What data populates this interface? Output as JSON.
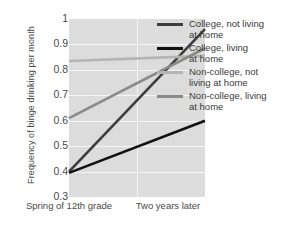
{
  "chart_data": {
    "type": "line",
    "title": "",
    "xlabel": "",
    "ylabel": "Frequency of binge drinking per month",
    "categories": [
      "Spring of\n12th grade",
      "Two years later"
    ],
    "x": [
      0,
      1
    ],
    "ylim": [
      0.3,
      1
    ],
    "yticks": [
      "1",
      "0.9",
      "0.8",
      "0.7",
      "0.6",
      "0.5",
      "0.4",
      "0.3"
    ],
    "ytick_values": [
      1,
      0.9,
      0.8,
      0.7,
      0.6,
      0.5,
      0.4,
      0.3
    ],
    "grid": true,
    "legend_position": "right",
    "plot_background": "#dcdcdc",
    "grid_color": "#f5f5f5",
    "series": [
      {
        "name": "College, not living\nat home",
        "color": "#3d3d3d",
        "values": [
          0.4,
          0.96
        ]
      },
      {
        "name": "College, living\nat home",
        "color": "#111111",
        "values": [
          0.395,
          0.6
        ]
      },
      {
        "name": "Non-college, not\nliving at home",
        "color": "#b4b4b4",
        "values": [
          0.835,
          0.855
        ]
      },
      {
        "name": "Non-college, living\nat home",
        "color": "#8a8a8a",
        "values": [
          0.61,
          0.885
        ]
      }
    ]
  },
  "axis": {
    "ylabel": "Frequency of binge drinking per month",
    "xtick0": "Spring of\n12th grade",
    "xtick1": "Two years later"
  },
  "legend": {
    "items": [
      {
        "label": "College, not living\nat home",
        "color": "#3d3d3d"
      },
      {
        "label": "College, living\nat home",
        "color": "#111111"
      },
      {
        "label": "Non-college, not\nliving at home",
        "color": "#b4b4b4"
      },
      {
        "label": "Non-college, living\nat home",
        "color": "#8a8a8a"
      }
    ]
  }
}
